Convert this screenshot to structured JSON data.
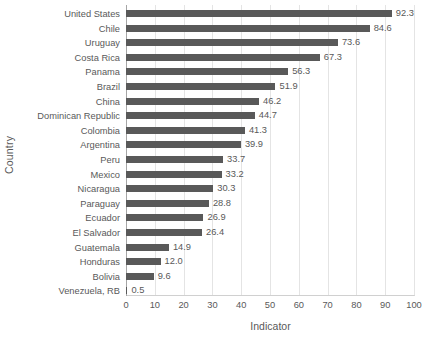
{
  "chart_data": {
    "type": "bar",
    "orientation": "horizontal",
    "title": "",
    "xlabel": "Indicator",
    "ylabel": "Country",
    "xlim": [
      0,
      100
    ],
    "xticks": [
      0,
      10,
      20,
      30,
      40,
      50,
      60,
      70,
      80,
      90,
      100
    ],
    "grid": "vertical",
    "legend": "none",
    "bar_color": "#595959",
    "categories": [
      "United States",
      "Chile",
      "Uruguay",
      "Costa Rica",
      "Panama",
      "Brazil",
      "China",
      "Dominican Republic",
      "Colombia",
      "Argentina",
      "Peru",
      "Mexico",
      "Nicaragua",
      "Paraguay",
      "Ecuador",
      "El Salvador",
      "Guatemala",
      "Honduras",
      "Bolivia",
      "Venezuela, RB"
    ],
    "values": [
      92.3,
      84.6,
      73.6,
      67.3,
      56.3,
      51.9,
      46.2,
      44.7,
      41.3,
      39.9,
      33.7,
      33.2,
      30.3,
      28.8,
      26.9,
      26.4,
      14.9,
      12.0,
      9.6,
      0.5
    ],
    "data_labels": [
      "92.3",
      "84.6",
      "73.6",
      "67.3",
      "56.3",
      "51.9",
      "46.2",
      "44.7",
      "41.3",
      "39.9",
      "33.7",
      "33.2",
      "30.3",
      "28.8",
      "26.9",
      "26.4",
      "14.9",
      "12.0",
      "9.6",
      "0.5"
    ]
  },
  "axes": {
    "x_title": "Indicator",
    "y_title": "Country",
    "x_tick_labels": [
      "0",
      "10",
      "20",
      "30",
      "40",
      "50",
      "60",
      "70",
      "80",
      "90",
      "100"
    ]
  },
  "colors": {
    "bar": "#595959",
    "text": "#595959",
    "gridline": "#e4e4e4",
    "axis": "#a6a6a6",
    "background": "#ffffff"
  }
}
